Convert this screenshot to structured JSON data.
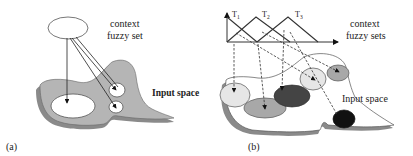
{
  "panel_a": {
    "label": "(a)",
    "context_line1": "context",
    "context_line2": "fuzzy set",
    "input_space": "Input space"
  },
  "panel_b": {
    "label": "(b)",
    "context_line1": "context",
    "context_line2": "fuzzy sets",
    "input_space": "Input space",
    "sets": [
      {
        "name": "T",
        "sub": "1"
      },
      {
        "name": "T",
        "sub": "2"
      },
      {
        "name": "T",
        "sub": "3"
      }
    ]
  },
  "colors": {
    "region": "#b5b5b5",
    "shadow": "#8a8a8a",
    "light_ellipse": "#e6e6e6",
    "mid_ellipse": "#a8a8a8",
    "dark_ellipse": "#444444",
    "black_ellipse": "#111111"
  }
}
